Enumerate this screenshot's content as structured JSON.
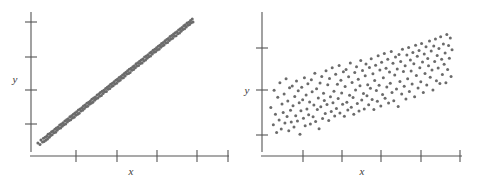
{
  "figure": {
    "background": "#ffffff",
    "point_color": "#6b6b6b",
    "axis_color": "#555555",
    "label_color": "#3a3a3a",
    "point_radius": 1.5,
    "panel_count": 2
  },
  "panels": [
    {
      "name": "left-scatterplot",
      "xlabel": "x",
      "ylabel": "y",
      "x_tick_count": 5,
      "y_tick_count": 4,
      "grid": false,
      "legend": false
    },
    {
      "name": "right-scatterplot",
      "xlabel": "x",
      "ylabel": "y",
      "x_tick_count": 5,
      "y_tick_count": 3,
      "grid": false,
      "legend": false
    }
  ],
  "chart_data": [
    {
      "type": "scatter",
      "title": "",
      "subtitle": "",
      "xlabel": "x",
      "ylabel": "y",
      "xlim": [
        0,
        100
      ],
      "ylim": [
        0,
        100
      ],
      "grid": false,
      "legend_position": "none",
      "annotations": [],
      "description": "Strong positive linear association; tightly clustered band of points rising left to right",
      "correlation": 0.97,
      "n_points": 182,
      "x_ticks": [
        14,
        33,
        52,
        71,
        90
      ],
      "y_ticks": [
        20,
        45,
        68,
        92
      ],
      "series": [
        {
          "name": "points",
          "x": [
            2.0,
            3.1,
            3.6,
            4.4,
            4.9,
            5.2,
            5.8,
            6.1,
            6.6,
            7.0,
            7.3,
            7.9,
            8.2,
            8.6,
            9.1,
            9.4,
            9.9,
            10.3,
            10.8,
            11.2,
            11.6,
            12.0,
            12.5,
            12.9,
            13.3,
            13.8,
            14.2,
            14.6,
            15.1,
            15.5,
            16.0,
            16.4,
            16.9,
            17.3,
            17.7,
            18.2,
            18.6,
            19.0,
            19.5,
            19.9,
            20.4,
            20.8,
            21.2,
            21.7,
            22.1,
            22.6,
            23.0,
            23.4,
            23.9,
            24.3,
            24.8,
            25.2,
            25.6,
            26.1,
            26.5,
            27.0,
            27.4,
            27.8,
            28.3,
            28.7,
            29.2,
            29.6,
            30.0,
            30.5,
            30.9,
            31.4,
            31.8,
            32.2,
            32.7,
            33.1,
            33.6,
            34.0,
            34.4,
            34.9,
            35.3,
            35.8,
            36.2,
            36.6,
            37.1,
            37.5,
            38.0,
            38.4,
            38.8,
            39.3,
            39.7,
            40.2,
            40.6,
            41.0,
            41.5,
            41.9,
            42.4,
            42.8,
            43.2,
            43.7,
            44.1,
            44.6,
            45.0,
            45.4,
            45.9,
            46.3,
            46.8,
            47.2,
            47.6,
            48.1,
            48.5,
            49.0,
            49.4,
            49.8,
            50.3,
            50.7,
            51.2,
            51.6,
            52.0,
            52.5,
            52.9,
            53.4,
            53.8,
            54.2,
            54.7,
            55.1,
            55.6,
            56.0,
            56.4,
            56.9,
            57.3,
            57.8,
            58.2,
            58.6,
            59.1,
            59.5,
            60.0,
            60.4,
            60.8,
            61.3,
            61.7,
            62.2,
            62.6,
            63.0,
            63.5,
            63.9,
            64.4,
            64.8,
            65.2,
            65.7,
            66.1,
            66.6,
            67.0,
            67.4,
            67.9,
            68.3,
            68.8,
            69.2,
            69.6,
            70.1,
            70.5,
            71.0,
            71.4,
            71.8,
            72.3,
            72.7,
            73.2,
            73.6,
            74.0,
            74.5,
            74.9,
            75.4,
            75.8,
            76.2,
            76.7,
            77.1,
            77.6,
            78.0,
            78.4,
            78.9,
            79.3,
            79.8,
            80.2,
            80.6,
            81.1,
            81.5,
            82.0,
            82.4
          ],
          "y": [
            5.2,
            4.1,
            7.3,
            5.9,
            8.6,
            6.2,
            9.4,
            7.1,
            10.2,
            8.0,
            11.5,
            9.3,
            12.1,
            10.6,
            13.4,
            11.2,
            14.0,
            12.7,
            15.3,
            13.1,
            16.2,
            14.5,
            17.0,
            15.8,
            18.3,
            16.1,
            19.2,
            17.4,
            20.0,
            18.6,
            21.3,
            19.1,
            22.2,
            20.5,
            23.0,
            21.7,
            24.4,
            22.2,
            25.1,
            23.6,
            26.3,
            24.0,
            27.2,
            25.5,
            28.1,
            26.3,
            29.4,
            27.0,
            30.2,
            28.6,
            31.1,
            29.2,
            32.4,
            30.5,
            33.0,
            31.8,
            34.3,
            32.1,
            35.2,
            33.6,
            36.0,
            34.4,
            37.3,
            35.1,
            38.2,
            36.5,
            39.0,
            37.7,
            40.4,
            38.2,
            41.1,
            39.6,
            42.3,
            40.0,
            43.2,
            41.5,
            44.0,
            42.8,
            45.3,
            43.1,
            46.2,
            44.6,
            47.0,
            45.2,
            48.4,
            46.7,
            49.1,
            47.3,
            50.2,
            48.5,
            51.3,
            49.0,
            52.1,
            50.6,
            53.4,
            51.2,
            54.0,
            52.7,
            55.2,
            53.1,
            56.3,
            54.5,
            57.1,
            55.8,
            58.2,
            56.3,
            59.4,
            57.0,
            60.1,
            58.6,
            61.3,
            59.2,
            62.0,
            60.5,
            63.4,
            61.7,
            64.1,
            62.2,
            65.3,
            63.6,
            66.2,
            64.0,
            67.0,
            65.5,
            68.3,
            66.1,
            69.2,
            67.4,
            70.0,
            68.6,
            71.4,
            69.2,
            72.1,
            70.5,
            73.3,
            71.8,
            74.0,
            72.2,
            75.2,
            73.6,
            76.3,
            74.1,
            77.1,
            75.5,
            78.4,
            76.7,
            79.0,
            77.2,
            80.3,
            78.6,
            81.2,
            79.0,
            82.0,
            80.5,
            83.4,
            81.7,
            84.1,
            82.2,
            85.3,
            83.6,
            86.2,
            84.0,
            87.0,
            85.5,
            88.3,
            86.1,
            89.2,
            87.4,
            90.0,
            88.6,
            91.4,
            89.2,
            92.1,
            90.5,
            93.3,
            91.8,
            94.0,
            92.2,
            95.2,
            93.6,
            96.3,
            94.1
          ]
        }
      ]
    },
    {
      "type": "scatter",
      "title": "",
      "subtitle": "",
      "xlabel": "x",
      "ylabel": "y",
      "xlim": [
        0,
        100
      ],
      "ylim": [
        0,
        100
      ],
      "grid": false,
      "legend_position": "none",
      "annotations": [],
      "description": "Weak to moderate positive association; widely dispersed cloud of points drifting upward to the right",
      "correlation": 0.52,
      "n_points": 205,
      "x_ticks": [
        16,
        33,
        50,
        67,
        84
      ],
      "y_ticks": [
        22,
        52,
        80
      ],
      "series": [
        {
          "name": "points",
          "x": [
            2.5,
            3.8,
            4.2,
            4.9,
            5.5,
            6.1,
            6.8,
            7.2,
            7.9,
            8.3,
            8.9,
            9.4,
            9.8,
            10.4,
            10.9,
            11.3,
            11.8,
            12.2,
            12.7,
            13.1,
            13.6,
            14.0,
            14.5,
            14.9,
            15.4,
            15.8,
            16.3,
            16.7,
            17.2,
            17.6,
            18.1,
            18.5,
            19.0,
            19.4,
            19.9,
            20.3,
            20.8,
            21.2,
            21.7,
            22.1,
            22.6,
            23.0,
            23.5,
            23.9,
            24.4,
            24.8,
            25.3,
            25.7,
            26.2,
            26.6,
            27.1,
            27.5,
            28.0,
            28.4,
            28.9,
            29.3,
            29.8,
            30.2,
            30.7,
            31.1,
            31.6,
            32.0,
            32.5,
            32.9,
            33.4,
            33.8,
            34.3,
            34.7,
            35.2,
            35.6,
            36.1,
            36.5,
            37.0,
            37.4,
            37.9,
            38.3,
            38.8,
            39.2,
            39.7,
            40.1,
            40.6,
            41.0,
            41.5,
            41.9,
            42.4,
            42.8,
            43.3,
            43.7,
            44.2,
            44.6,
            45.1,
            45.5,
            46.0,
            46.4,
            46.9,
            47.3,
            47.8,
            48.2,
            48.7,
            49.1,
            49.6,
            50.0,
            50.5,
            50.9,
            51.4,
            51.8,
            52.3,
            52.7,
            53.2,
            53.6,
            54.1,
            54.5,
            55.0,
            55.4,
            55.9,
            56.3,
            56.8,
            57.2,
            57.7,
            58.1,
            58.6,
            59.0,
            59.5,
            59.9,
            60.4,
            60.8,
            61.3,
            61.7,
            62.2,
            62.6,
            63.1,
            63.5,
            64.0,
            64.4,
            64.9,
            65.3,
            65.8,
            66.2,
            66.7,
            67.1,
            67.6,
            68.0,
            68.5,
            68.9,
            69.4,
            69.8,
            70.3,
            70.7,
            71.2,
            71.6,
            72.1,
            72.5,
            73.0,
            73.4,
            73.9,
            74.3,
            74.8,
            75.2,
            75.7,
            76.1,
            76.6,
            77.0,
            77.5,
            77.9,
            78.4,
            78.8,
            79.3,
            79.7,
            80.2,
            80.6,
            81.1,
            81.5,
            82.0,
            82.4,
            82.9,
            83.3,
            83.8,
            84.2,
            84.7,
            85.1,
            85.6,
            86.0,
            86.5,
            86.9,
            87.4,
            87.8,
            88.3,
            88.7,
            89.2,
            89.6,
            90.1,
            90.5,
            91.0,
            91.4,
            91.9,
            92.3,
            92.8,
            93.2,
            93.7,
            94.1,
            94.6,
            95.0,
            95.5,
            95.9,
            96.4
          ],
          "y": [
            31.2,
            18.5,
            44.0,
            26.3,
            12.8,
            38.7,
            22.1,
            49.5,
            15.4,
            33.9,
            27.6,
            41.2,
            19.8,
            52.3,
            24.7,
            36.1,
            14.2,
            45.8,
            29.3,
            20.6,
            47.1,
            32.5,
            16.9,
            39.4,
            25.2,
            50.8,
            21.3,
            43.6,
            34.7,
            11.5,
            28.9,
            46.2,
            37.0,
            23.4,
            53.1,
            17.8,
            40.5,
            30.2,
            48.7,
            26.0,
            35.3,
            19.1,
            51.6,
            42.8,
            24.5,
            33.1,
            56.4,
            20.9,
            45.0,
            29.7,
            38.2,
            15.6,
            49.3,
            31.8,
            54.0,
            23.1,
            41.7,
            36.4,
            26.8,
            58.2,
            33.5,
            47.9,
            21.7,
            52.6,
            39.1,
            28.3,
            60.4,
            34.8,
            43.2,
            25.0,
            55.7,
            30.6,
            48.4,
            37.9,
            62.1,
            27.2,
            51.3,
            42.0,
            33.7,
            57.5,
            24.8,
            46.6,
            59.2,
            35.1,
            29.4,
            53.8,
            40.3,
            64.0,
            31.5,
            49.7,
            38.6,
            26.2,
            56.9,
            44.1,
            61.3,
            34.2,
            52.0,
            28.7,
            47.3,
            65.8,
            36.8,
            58.4,
            41.5,
            30.1,
            54.6,
            63.2,
            39.8,
            48.0,
            33.3,
            60.7,
            45.4,
            67.1,
            37.2,
            56.0,
            29.8,
            51.1,
            62.4,
            43.7,
            35.9,
            69.3,
            47.6,
            58.8,
            32.4,
            64.5,
            40.9,
            53.2,
            71.0,
            38.1,
            60.2,
            46.3,
            66.7,
            34.6,
            57.4,
            49.0,
            72.5,
            42.2,
            63.8,
            36.3,
            55.1,
            68.4,
            44.8,
            59.6,
            31.9,
            70.2,
            50.3,
            65.0,
            41.1,
            74.1,
            57.7,
            46.9,
            61.9,
            37.5,
            69.8,
            52.4,
            75.3,
            43.0,
            66.2,
            58.1,
            48.5,
            71.7,
            63.4,
            39.2,
            77.0,
            54.8,
            68.9,
            45.6,
            73.2,
            60.5,
            50.1,
            78.4,
            64.7,
            42.3,
            70.6,
            56.2,
            75.9,
            47.8,
            67.3,
            62.0,
            80.1,
            53.5,
            72.8,
            58.9,
            44.2,
            76.4,
            65.1,
            81.7,
            51.0,
            69.5,
            60.3,
            74.6,
            48.9,
            83.2,
            66.8,
            55.6,
            78.0,
            63.1,
            71.4,
            49.5,
            85.0,
            59.2,
            76.9,
            67.5,
            82.3,
            54.1,
            73.7
          ]
        }
      ]
    }
  ]
}
